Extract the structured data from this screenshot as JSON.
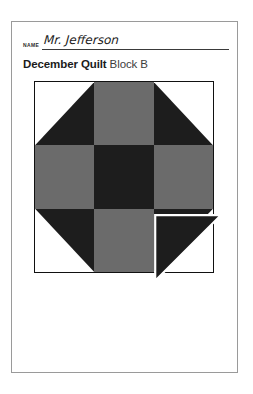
{
  "page": {
    "background_color": "#ffffff",
    "card_border_color": "#9a9a9a"
  },
  "header": {
    "name_label": "NAME",
    "name_value": "Mr. Jefferson"
  },
  "title": {
    "main": "December Quilt",
    "sub": "Block B"
  },
  "quilt": {
    "rows": 3,
    "columns": 3,
    "colors": {
      "dark": "#1d1d1d",
      "gray": "#6b6b6b",
      "white": "#ffffff",
      "outline": "#111111"
    },
    "cells": [
      {
        "name": "cell-top-left",
        "type": "half-square-triangle",
        "orientation": "dark-bottom-right"
      },
      {
        "name": "cell-top-center",
        "type": "solid",
        "fill": "gray"
      },
      {
        "name": "cell-top-right",
        "type": "half-square-triangle",
        "orientation": "dark-bottom-left"
      },
      {
        "name": "cell-middle-left",
        "type": "solid",
        "fill": "gray"
      },
      {
        "name": "cell-middle-center",
        "type": "solid",
        "fill": "dark"
      },
      {
        "name": "cell-middle-right",
        "type": "solid",
        "fill": "gray"
      },
      {
        "name": "cell-bottom-left",
        "type": "half-square-triangle",
        "orientation": "dark-top-right"
      },
      {
        "name": "cell-bottom-center",
        "type": "solid",
        "fill": "gray"
      },
      {
        "name": "cell-bottom-right",
        "type": "half-square-triangle",
        "orientation": "dark-top-left"
      }
    ],
    "detached_patch": {
      "name": "detached-corner-triangle",
      "orientation": "dark-top-left",
      "fill": "dark",
      "offset_x": 14,
      "offset_y": 14
    }
  }
}
